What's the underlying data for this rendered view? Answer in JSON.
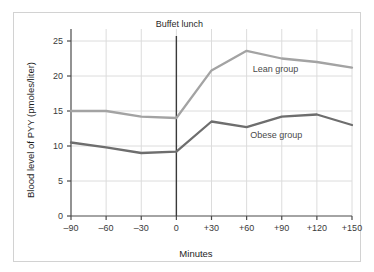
{
  "figure": {
    "frame_color": "#d2d2d2",
    "background": "#ffffff"
  },
  "chart_data": {
    "type": "line",
    "title": "",
    "xlabel": "Minutes",
    "ylabel": "Blood level of PYY (pmoles/liter)",
    "x": [
      -90,
      -60,
      -30,
      0,
      30,
      60,
      90,
      120,
      150
    ],
    "xtick_labels": [
      "–90",
      "–60",
      "–30",
      "0",
      "+30",
      "+60",
      "+90",
      "+120",
      "+150"
    ],
    "ytick_labels": [
      "0",
      "5",
      "10",
      "15",
      "20",
      "25"
    ],
    "yticks": [
      0,
      5,
      10,
      15,
      20,
      25
    ],
    "xlim": [
      -90,
      150
    ],
    "ylim": [
      0,
      26
    ],
    "grid": true,
    "legend_position": "inline-annotations",
    "series": [
      {
        "name": "Lean group",
        "color": "#a3a3a3",
        "label": "Lean group",
        "values": [
          15.0,
          15.0,
          14.2,
          14.0,
          20.8,
          23.6,
          22.5,
          22.0,
          21.2
        ]
      },
      {
        "name": "Obese group",
        "color": "#6e6e6e",
        "label": "Obese group",
        "values": [
          10.5,
          9.8,
          9.0,
          9.2,
          13.5,
          12.7,
          14.2,
          14.5,
          13.0
        ]
      }
    ],
    "annotations": [
      {
        "name": "buffet-lunch",
        "label": "Buffet lunch",
        "x": 0,
        "type": "vertical-line",
        "color": "#3a3a3a"
      }
    ]
  }
}
